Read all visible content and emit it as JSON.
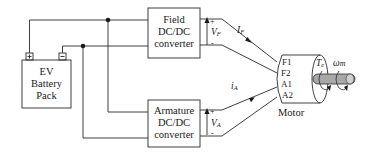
{
  "diagram": {
    "type": "ev-dc-motor-drive-schematic",
    "battery": {
      "lines": [
        "EV",
        "Battery",
        "Pack"
      ],
      "pos_terminal": "+",
      "neg_terminal": "-"
    },
    "field_converter": {
      "lines": [
        "Field",
        "DC/DC",
        "converter"
      ],
      "voltage_label": "V",
      "voltage_sub": "F",
      "plus": "+",
      "minus": "-"
    },
    "armature_converter": {
      "lines": [
        "Armature",
        "DC/DC",
        "converter"
      ],
      "voltage_label": "V",
      "voltage_sub": "A",
      "plus": "+",
      "minus": "-"
    },
    "currents": {
      "field": {
        "label": "I",
        "sub": "F"
      },
      "armature": {
        "label": "i",
        "sub": "A"
      }
    },
    "motor": {
      "label": "Motor",
      "terminals": [
        "F1",
        "F2",
        "A1",
        "A2"
      ],
      "torque_label": "T",
      "torque_sub": "e",
      "speed_label": "ω",
      "speed_sub": "m"
    },
    "colors": {
      "line": "#2a2a2a",
      "shaft": "#a8a8a8",
      "shaft_end": "#cfcfcf"
    }
  }
}
